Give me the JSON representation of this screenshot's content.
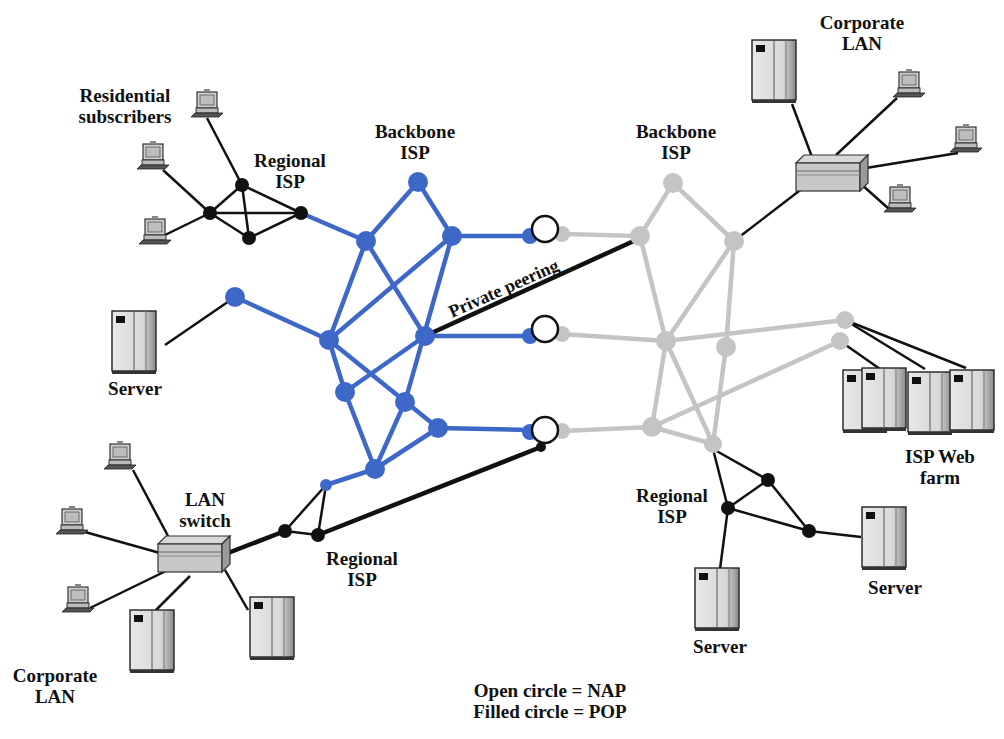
{
  "diagram": {
    "colors": {
      "backbone_left": "#3e68c8",
      "backbone_right": "#c4c4c4",
      "link_black": "#111111",
      "nap_fill": "#ffffff"
    },
    "labels": {
      "residential": [
        "Residential",
        "subscribers"
      ],
      "regional_isp_top_left": [
        "Regional",
        "ISP"
      ],
      "backbone_left": [
        "Backbone",
        "ISP"
      ],
      "backbone_right": [
        "Backbone",
        "ISP"
      ],
      "corporate_lan_top_right": [
        "Corporate",
        "LAN"
      ],
      "private_peering": "Private peering",
      "server_left": "Server",
      "lan_switch": [
        "LAN",
        "switch"
      ],
      "regional_isp_bottom_left": [
        "Regional",
        "ISP"
      ],
      "corporate_lan_bottom_left": [
        "Corporate",
        "LAN"
      ],
      "isp_web_farm": [
        "ISP Web",
        "farm"
      ],
      "regional_isp_bottom_right": [
        "Regional",
        "ISP"
      ],
      "server_bottom_right": "Server",
      "server_bottom_center": "Server"
    },
    "legend": {
      "open_circle": "Open circle = NAP",
      "filled_circle": "Filled circle = POP"
    },
    "icons": {
      "workstation": "desktop-computer-icon",
      "server": "server-tower-icon",
      "switch": "network-switch-icon",
      "nap": "open-circle",
      "pop": "filled-circle"
    }
  }
}
